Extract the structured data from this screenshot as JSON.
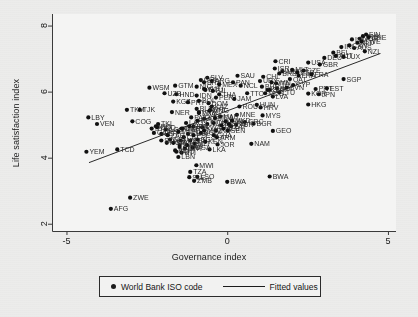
{
  "chart_data": {
    "type": "scatter",
    "title": "",
    "xlabel": "Governance index",
    "ylabel": "Life satisfaction index",
    "xlim": [
      -5.45,
      5.25
    ],
    "ylim": [
      1.78,
      8.35
    ],
    "xticks": [
      -5,
      0,
      5
    ],
    "yticks": [
      2,
      4,
      6,
      8
    ],
    "grid": false,
    "legend_position": "below-axes",
    "legend": [
      {
        "label": "World Bank ISO code",
        "marker": "dot"
      },
      {
        "label": "Fitted values",
        "marker": "line"
      }
    ],
    "fit_line": {
      "x": [
        -4.3,
        4.75
      ],
      "y": [
        3.85,
        7.15
      ]
    },
    "point_label_field": "World Bank ISO code",
    "points": [
      {
        "label": "AFG",
        "x": -3.62,
        "y": 2.45
      },
      {
        "label": "ZWE",
        "x": -3.02,
        "y": 2.79
      },
      {
        "label": "ZMB",
        "x": -1.03,
        "y": 3.3
      },
      {
        "label": "LSO",
        "x": -0.93,
        "y": 3.42
      },
      {
        "label": "SLE",
        "x": -1.18,
        "y": 3.41
      },
      {
        "label": "TZA",
        "x": -1.15,
        "y": 3.57
      },
      {
        "label": "MWI",
        "x": -0.96,
        "y": 3.77
      },
      {
        "label": "BWA",
        "x": 0.0,
        "y": 3.27
      },
      {
        "label": "BWA",
        "x": 1.32,
        "y": 3.43
      },
      {
        "label": "LKA",
        "x": -0.55,
        "y": 4.25
      },
      {
        "label": "JOR",
        "x": -0.3,
        "y": 4.4
      },
      {
        "label": "NAM",
        "x": 0.75,
        "y": 4.42
      },
      {
        "label": "GEO",
        "x": 1.42,
        "y": 4.81
      },
      {
        "label": "BGR",
        "x": 0.82,
        "y": 5.03
      },
      {
        "label": "MYS",
        "x": 1.1,
        "y": 5.28
      },
      {
        "label": "HRV",
        "x": 1.04,
        "y": 5.52
      },
      {
        "label": "MNE",
        "x": 0.3,
        "y": 5.3
      },
      {
        "label": "HKG",
        "x": 2.52,
        "y": 5.61
      },
      {
        "label": "JPN",
        "x": 2.85,
        "y": 5.92
      },
      {
        "label": "KOR",
        "x": 2.52,
        "y": 5.94
      },
      {
        "label": "PRT",
        "x": 2.75,
        "y": 6.08
      },
      {
        "label": "EST",
        "x": 3.1,
        "y": 6.1
      },
      {
        "label": "SGP",
        "x": 3.62,
        "y": 6.38
      },
      {
        "label": "ITA",
        "x": 1.52,
        "y": 6.25
      },
      {
        "label": "ARE",
        "x": 1.72,
        "y": 6.62
      },
      {
        "label": "MLT",
        "x": 2.02,
        "y": 6.66
      },
      {
        "label": "CZE",
        "x": 2.38,
        "y": 6.64
      },
      {
        "label": "USA",
        "x": 2.52,
        "y": 6.88
      },
      {
        "label": "CRI",
        "x": 1.5,
        "y": 6.92
      },
      {
        "label": "ESP",
        "x": 2.18,
        "y": 6.58
      },
      {
        "label": "BEL",
        "x": 3.3,
        "y": 7.18
      },
      {
        "label": "IRL",
        "x": 3.55,
        "y": 7.35
      },
      {
        "label": "NZL",
        "x": 4.28,
        "y": 7.22
      },
      {
        "label": "AUS",
        "x": 3.95,
        "y": 7.32
      },
      {
        "label": "CAN",
        "x": 3.8,
        "y": 7.4
      },
      {
        "label": "NLD",
        "x": 4.05,
        "y": 7.48
      },
      {
        "label": "NOR",
        "x": 4.12,
        "y": 7.6
      },
      {
        "label": "DNK",
        "x": 4.22,
        "y": 7.68
      },
      {
        "label": "FIN",
        "x": 4.32,
        "y": 7.73
      },
      {
        "label": "CHE",
        "x": 4.4,
        "y": 7.65
      },
      {
        "label": "ISL",
        "x": 3.88,
        "y": 7.58
      },
      {
        "label": "SWE",
        "x": 4.18,
        "y": 7.52
      },
      {
        "label": "LBY",
        "x": -4.32,
        "y": 5.22
      },
      {
        "label": "VEN",
        "x": -4.05,
        "y": 5.02
      },
      {
        "label": "YEM",
        "x": -4.38,
        "y": 4.18
      },
      {
        "label": "TCD",
        "x": -3.42,
        "y": 4.25
      },
      {
        "label": "TKM",
        "x": -3.12,
        "y": 5.45
      },
      {
        "label": "TJK",
        "x": -2.72,
        "y": 5.45
      },
      {
        "label": "COG",
        "x": -2.95,
        "y": 5.1
      },
      {
        "label": "WSM",
        "x": -2.42,
        "y": 6.12
      },
      {
        "label": "GTM",
        "x": -1.62,
        "y": 6.18
      },
      {
        "label": "HND",
        "x": -1.58,
        "y": 5.92
      },
      {
        "label": "KGZ",
        "x": -1.68,
        "y": 5.7
      },
      {
        "label": "NER",
        "x": -1.72,
        "y": 5.38
      },
      {
        "label": "PRY",
        "x": -1.22,
        "y": 5.68
      },
      {
        "label": "IDN",
        "x": -0.95,
        "y": 5.88
      },
      {
        "label": "SLV",
        "x": -0.62,
        "y": 6.42
      },
      {
        "label": "BRA",
        "x": -0.72,
        "y": 6.28
      },
      {
        "label": "ARG",
        "x": -0.48,
        "y": 6.32
      },
      {
        "label": "MEX",
        "x": -0.25,
        "y": 6.22
      },
      {
        "label": "NCL",
        "x": 0.42,
        "y": 6.18
      },
      {
        "label": "VNM",
        "x": -0.88,
        "y": 5.38
      },
      {
        "label": "PHL",
        "x": -0.52,
        "y": 5.45
      },
      {
        "label": "LBR",
        "x": -2.05,
        "y": 4.72
      },
      {
        "label": "LBN",
        "x": -1.52,
        "y": 4.02
      },
      {
        "label": "HTI",
        "x": -1.42,
        "y": 4.15
      },
      {
        "label": "SWZ",
        "x": -1.48,
        "y": 4.38
      },
      {
        "label": "BEN",
        "x": -1.15,
        "y": 4.52
      },
      {
        "label": "NGA",
        "x": -1.88,
        "y": 4.45
      },
      {
        "label": "IRQ",
        "x": -2.22,
        "y": 4.95
      },
      {
        "label": "UKR",
        "x": -1.38,
        "y": 4.88
      },
      {
        "label": "RUS",
        "x": -0.62,
        "y": 5.02
      },
      {
        "label": "CHN",
        "x": -0.42,
        "y": 5.05
      },
      {
        "label": "IND",
        "x": -0.35,
        "y": 4.82
      },
      {
        "label": "ZAF",
        "x": 0.12,
        "y": 4.95
      },
      {
        "label": "TUR",
        "x": 0.28,
        "y": 5.0
      },
      {
        "label": "GRC",
        "x": 0.55,
        "y": 5.08
      },
      {
        "label": "POL",
        "x": 1.55,
        "y": 6.1
      },
      {
        "label": "SVK",
        "x": 1.32,
        "y": 6.05
      },
      {
        "label": "LTU",
        "x": 1.62,
        "y": 5.98
      },
      {
        "label": "FRA",
        "x": 2.22,
        "y": 6.48
      },
      {
        "label": "GBR",
        "x": 2.88,
        "y": 6.82
      },
      {
        "label": "DEU",
        "x": 3.02,
        "y": 7.02
      },
      {
        "label": "AUT",
        "x": 3.38,
        "y": 7.08
      },
      {
        "label": "THA",
        "x": -0.25,
        "y": 5.92
      },
      {
        "label": "COL",
        "x": -0.82,
        "y": 6.35
      },
      {
        "label": "CHL",
        "x": 1.12,
        "y": 6.45
      },
      {
        "label": "URY",
        "x": 1.02,
        "y": 6.32
      },
      {
        "label": "PAN",
        "x": 0.18,
        "y": 6.28
      },
      {
        "label": "ECU",
        "x": -0.68,
        "y": 6.05
      },
      {
        "label": "PER",
        "x": -0.35,
        "y": 5.82
      },
      {
        "label": "DOM",
        "x": -0.58,
        "y": 5.65
      },
      {
        "label": "MAR",
        "x": -0.22,
        "y": 5.25
      },
      {
        "label": "TUN",
        "x": -0.05,
        "y": 5.1
      },
      {
        "label": "KAZ",
        "x": -0.48,
        "y": 5.55
      },
      {
        "label": "AZE",
        "x": -0.72,
        "y": 5.18
      },
      {
        "label": "ARM",
        "x": -0.32,
        "y": 4.62
      },
      {
        "label": "BIH",
        "x": -0.18,
        "y": 4.98
      },
      {
        "label": "SRB",
        "x": 0.05,
        "y": 5.02
      },
      {
        "label": "ALB",
        "x": -0.12,
        "y": 4.88
      },
      {
        "label": "EGY",
        "x": -0.92,
        "y": 4.55
      },
      {
        "label": "KEN",
        "x": -0.68,
        "y": 4.48
      },
      {
        "label": "GHA",
        "x": -0.42,
        "y": 4.68
      },
      {
        "label": "SEN",
        "x": 0.02,
        "y": 4.82
      },
      {
        "label": "MLI",
        "x": -1.02,
        "y": 4.42
      },
      {
        "label": "BFA",
        "x": -1.25,
        "y": 4.38
      },
      {
        "label": "UGA",
        "x": -1.08,
        "y": 4.3
      },
      {
        "label": "ETH",
        "x": -1.32,
        "y": 4.28
      },
      {
        "label": "RWA",
        "x": -0.78,
        "y": 4.92
      },
      {
        "label": "CMR",
        "x": -1.22,
        "y": 4.72
      },
      {
        "label": "CIV",
        "x": -1.35,
        "y": 4.62
      },
      {
        "label": "MDG",
        "x": -1.45,
        "y": 4.52
      },
      {
        "label": "NPL",
        "x": -0.92,
        "y": 5.12
      },
      {
        "label": "BGD",
        "x": -0.82,
        "y": 4.75
      },
      {
        "label": "PAK",
        "x": -1.12,
        "y": 5.22
      },
      {
        "label": "IRN",
        "x": -1.05,
        "y": 4.95
      },
      {
        "label": "DZA",
        "x": -0.88,
        "y": 5.35
      },
      {
        "label": "MNG",
        "x": -0.55,
        "y": 5.42
      },
      {
        "label": "MDA",
        "x": -0.38,
        "y": 5.2
      },
      {
        "label": "BLR",
        "x": -0.95,
        "y": 5.48
      },
      {
        "label": "ROU",
        "x": 0.38,
        "y": 5.55
      },
      {
        "label": "HUN",
        "x": 0.92,
        "y": 5.6
      },
      {
        "label": "LVA",
        "x": 1.42,
        "y": 5.85
      },
      {
        "label": "SVN",
        "x": 1.85,
        "y": 6.12
      },
      {
        "label": "CYP",
        "x": 2.05,
        "y": 6.2
      },
      {
        "label": "ISR",
        "x": 1.48,
        "y": 6.7
      },
      {
        "label": "QAT",
        "x": 1.95,
        "y": 6.38
      },
      {
        "label": "KWT",
        "x": 1.25,
        "y": 6.05
      },
      {
        "label": "SAU",
        "x": 0.32,
        "y": 6.48
      },
      {
        "label": "UZB",
        "x": -1.95,
        "y": 5.95
      },
      {
        "label": "TKL",
        "x": -2.15,
        "y": 5.02
      },
      {
        "label": "GIN",
        "x": -1.78,
        "y": 4.55
      },
      {
        "label": "MRT",
        "x": -1.68,
        "y": 4.45
      },
      {
        "label": "TGO",
        "x": -1.58,
        "y": 4.18
      },
      {
        "label": "COM",
        "x": -1.48,
        "y": 4.32
      },
      {
        "label": "AGO",
        "x": -1.92,
        "y": 4.85
      },
      {
        "label": "SDN",
        "x": -2.05,
        "y": 4.52
      },
      {
        "label": "KHM",
        "x": -1.18,
        "y": 4.95
      },
      {
        "label": "LAO",
        "x": -1.28,
        "y": 5.05
      },
      {
        "label": "MMR",
        "x": -1.52,
        "y": 4.78
      },
      {
        "label": "MKD",
        "x": 0.15,
        "y": 5.12
      },
      {
        "label": "JAM",
        "x": 0.22,
        "y": 5.78
      },
      {
        "label": "TTO",
        "x": 0.62,
        "y": 5.95
      },
      {
        "label": "MUS",
        "x": 1.18,
        "y": 5.95
      },
      {
        "label": "BRB",
        "x": 1.62,
        "y": 6.55
      },
      {
        "label": "OMN",
        "x": 1.38,
        "y": 6.28
      },
      {
        "label": "BHR",
        "x": 1.08,
        "y": 6.15
      },
      {
        "label": "LUX",
        "x": 3.62,
        "y": 7.05
      },
      {
        "label": "FRA2",
        "x": 2.62,
        "y": 6.52
      },
      {
        "label": "NIC",
        "x": -0.95,
        "y": 6.15
      },
      {
        "label": "BOL",
        "x": -0.88,
        "y": 5.72
      },
      {
        "label": "VUT",
        "x": -0.72,
        "y": 6.08
      },
      {
        "label": "FJI",
        "x": -0.45,
        "y": 6.02
      },
      {
        "label": "PSE",
        "x": -1.05,
        "y": 4.68
      },
      {
        "label": "SYR",
        "x": -2.35,
        "y": 4.88
      },
      {
        "label": "MOZ",
        "x": -0.72,
        "y": 4.82
      },
      {
        "label": "COD",
        "x": -2.18,
        "y": 4.92
      },
      {
        "label": "CAF",
        "x": -2.28,
        "y": 4.75
      },
      {
        "label": "BDI",
        "x": -1.62,
        "y": 4.22
      },
      {
        "label": "GMB",
        "x": -1.42,
        "y": 4.88
      },
      {
        "label": "ZAR",
        "x": -1.85,
        "y": 4.68
      }
    ]
  }
}
